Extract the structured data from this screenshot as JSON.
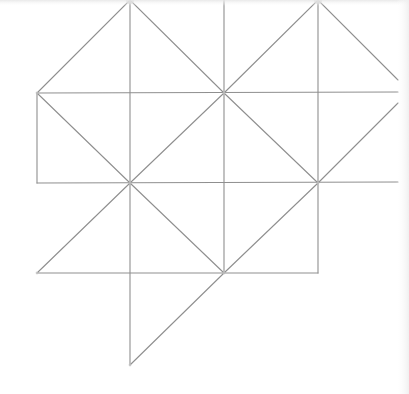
{
  "diagram": {
    "title": "",
    "stroke_color": "#8f8f8f",
    "background_color": "#ffffff",
    "grid": {
      "x": [
        37,
        130,
        224,
        318,
        398
      ],
      "y": [
        0,
        93,
        183,
        273,
        365
      ]
    },
    "edges": [
      {
        "id": "top-left-peak-left",
        "x1": 37,
        "y1": 93,
        "x2": 130,
        "y2": 0
      },
      {
        "id": "top-left-peak-right",
        "x1": 130,
        "y1": 0,
        "x2": 224,
        "y2": 93
      },
      {
        "id": "top-right-peak-left",
        "x1": 224,
        "y1": 93,
        "x2": 318,
        "y2": 0
      },
      {
        "id": "top-right-peak-right",
        "x1": 318,
        "y1": 0,
        "x2": 398,
        "y2": 80
      },
      {
        "id": "vertical-130-upper",
        "x1": 130,
        "y1": 0,
        "x2": 130,
        "y2": 183
      },
      {
        "id": "vertical-130-lower",
        "x1": 130,
        "y1": 183,
        "x2": 130,
        "y2": 365
      },
      {
        "id": "vertical-224",
        "x1": 224,
        "y1": 0,
        "x2": 224,
        "y2": 273
      },
      {
        "id": "vertical-318",
        "x1": 318,
        "y1": 0,
        "x2": 318,
        "y2": 273
      },
      {
        "id": "vertical-37",
        "x1": 37,
        "y1": 93,
        "x2": 37,
        "y2": 183
      },
      {
        "id": "horizontal-93",
        "x1": 37,
        "y1": 93,
        "x2": 398,
        "y2": 92
      },
      {
        "id": "horizontal-183",
        "x1": 37,
        "y1": 183,
        "x2": 398,
        "y2": 182
      },
      {
        "id": "horizontal-273",
        "x1": 37,
        "y1": 273,
        "x2": 318,
        "y2": 273
      },
      {
        "id": "diag-left-square-down",
        "x1": 37,
        "y1": 93,
        "x2": 130,
        "y2": 183
      },
      {
        "id": "diag-center-up",
        "x1": 130,
        "y1": 183,
        "x2": 224,
        "y2": 93
      },
      {
        "id": "diag-center-down",
        "x1": 224,
        "y1": 93,
        "x2": 318,
        "y2": 183
      },
      {
        "id": "diag-right-up",
        "x1": 318,
        "y1": 183,
        "x2": 398,
        "y2": 103
      },
      {
        "id": "diag-lower-left",
        "x1": 37,
        "y1": 273,
        "x2": 130,
        "y2": 183
      },
      {
        "id": "diag-lower-center",
        "x1": 130,
        "y1": 183,
        "x2": 224,
        "y2": 273
      },
      {
        "id": "diag-lower-right-up",
        "x1": 224,
        "y1": 273,
        "x2": 318,
        "y2": 183
      },
      {
        "id": "diag-bottom-tail",
        "x1": 130,
        "y1": 365,
        "x2": 224,
        "y2": 273
      }
    ],
    "vertices": [
      {
        "id": "apex-left",
        "x": 130,
        "y": 0
      },
      {
        "id": "apex-right",
        "x": 318,
        "y": 0
      },
      {
        "id": "left-corner",
        "x": 37,
        "y": 93
      },
      {
        "id": "center-upper",
        "x": 224,
        "y": 93
      },
      {
        "id": "center-lower",
        "x": 130,
        "y": 183
      },
      {
        "id": "right-lower",
        "x": 318,
        "y": 183
      },
      {
        "id": "bottom-center",
        "x": 224,
        "y": 273
      },
      {
        "id": "bottom-left",
        "x": 37,
        "y": 273
      },
      {
        "id": "bottom-tip",
        "x": 130,
        "y": 365
      }
    ]
  }
}
